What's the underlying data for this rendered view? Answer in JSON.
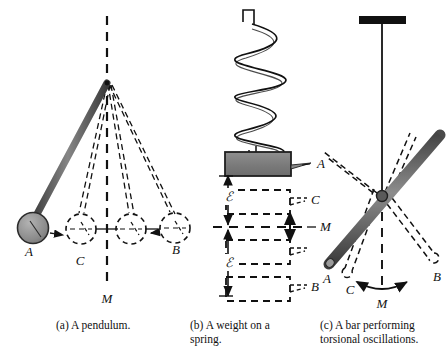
{
  "figure": {
    "title_visible": false,
    "background_color": "#ffffff",
    "ink_color": "#111111",
    "panels": [
      {
        "id": "a",
        "caption": "(a) A pendulum.",
        "name": "pendulum-panel",
        "labels": [
          {
            "text": "A",
            "role": "extreme-left-position"
          },
          {
            "text": "C",
            "role": "intermediate-position"
          },
          {
            "text": "B",
            "role": "extreme-right-position"
          },
          {
            "text": "M",
            "role": "equilibrium-axis"
          }
        ],
        "elements": {
          "pivot": "pivot-point",
          "rod": "pendulum-rod",
          "bob": "pendulum-bob",
          "bob_color": "#8c8c8c",
          "ghost_positions": 3,
          "equilibrium_line": "dashed-vertical-axis"
        }
      },
      {
        "id": "b",
        "caption": "(b) A weight on a spring.",
        "name": "spring-panel",
        "labels": [
          {
            "text": "A",
            "role": "top-extreme-position"
          },
          {
            "text": "C",
            "role": "intermediate-position"
          },
          {
            "text": "M",
            "role": "equilibrium-position"
          },
          {
            "text": "B",
            "role": "bottom-extreme-position"
          },
          {
            "text": "ℐ",
            "role": "amplitude-upper"
          },
          {
            "text": "ℐ",
            "role": "amplitude-lower"
          }
        ],
        "elements": {
          "spring": "helical-spring",
          "weight": "weight-block",
          "weight_color": "#7d7d7d",
          "ghost_positions": 3,
          "equilibrium_line": "dashed-horizontal-axis",
          "motion_arrow": "vertical-double-arrow"
        }
      },
      {
        "id": "c",
        "caption": "(c) A bar performing torsional oscillations.",
        "name": "torsion-panel",
        "labels": [
          {
            "text": "A",
            "role": "extreme-left-position"
          },
          {
            "text": "C",
            "role": "intermediate-position"
          },
          {
            "text": "B",
            "role": "extreme-right-position"
          },
          {
            "text": "M",
            "role": "equilibrium-axis"
          }
        ],
        "elements": {
          "support": "ceiling-support-bar",
          "support_color": "#111111",
          "wire": "torsion-wire",
          "bar": "torsion-bar",
          "bar_color": "#8c8c8c",
          "ghost_positions": 3,
          "equilibrium_line": "dashed-vertical-axis",
          "motion_arrow": "curved-double-arrow"
        }
      }
    ]
  }
}
